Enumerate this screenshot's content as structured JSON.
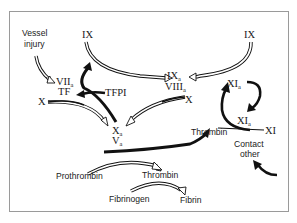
{
  "diagram": {
    "nodes": {
      "vessel_injury": {
        "line1": "Vessel",
        "line2": "injury"
      },
      "ix_left": "IX",
      "ix_right": "IX",
      "viia": {
        "main": "VII",
        "sub": "a"
      },
      "tf": "TF",
      "tfpi": "TFPI",
      "x_left": "X",
      "x_right": "X",
      "ixa": {
        "main": "IX",
        "sub": "a"
      },
      "viiia": {
        "main": "VIII",
        "sub": "a"
      },
      "xa": {
        "main": "X",
        "sub": "a"
      },
      "va": {
        "main": "V",
        "sub": "a"
      },
      "xia_top": {
        "main": "XI",
        "sub": "a"
      },
      "xia_mid": {
        "main": "XI",
        "sub": "a"
      },
      "xi": "XI",
      "thrombin_right": "Thrombin",
      "contact_other": {
        "line1": "Contact",
        "line2": "other"
      },
      "prothrombin": "Prothrombin",
      "thrombin_bottom": "Thrombin",
      "fibrinogen": "Fibrinogen",
      "fibrin": "Fibrin"
    },
    "edges": [
      {
        "from": "Vessel injury",
        "to": "VIIa/TF",
        "style": "hollow"
      },
      {
        "from": "IX (left)",
        "to": "IXa/VIIIa",
        "style": "hollow"
      },
      {
        "from": "IX (right)",
        "to": "IXa/VIIIa",
        "style": "hollow"
      },
      {
        "from": "TFPI",
        "to": "VIIa/TF",
        "style": "solid-inhibit"
      },
      {
        "from": "X (left)",
        "to": "Xa/Va",
        "style": "hollow"
      },
      {
        "from": "X (right)",
        "to": "Xa/Va",
        "style": "hollow"
      },
      {
        "from": "Xa/Va",
        "to": "VIIa/TF",
        "style": "solid"
      },
      {
        "from": "Prothrombin",
        "to": "Thrombin",
        "style": "hollow"
      },
      {
        "from": "Xa/Va",
        "to": "Thrombin (right)",
        "style": "solid"
      },
      {
        "from": "Fibrinogen",
        "to": "Fibrin",
        "style": "hollow"
      },
      {
        "from": "Thrombin",
        "to": "XIa",
        "style": "solid"
      },
      {
        "from": "XIa",
        "to": "XIa",
        "style": "solid"
      },
      {
        "from": "XI",
        "to": "XIa",
        "style": "thin"
      },
      {
        "from": "Contact other",
        "to": "XI",
        "style": "solid"
      }
    ],
    "colors": {
      "line": "#111111",
      "frame": "#9a9a9a",
      "background": "#ffffff"
    }
  }
}
